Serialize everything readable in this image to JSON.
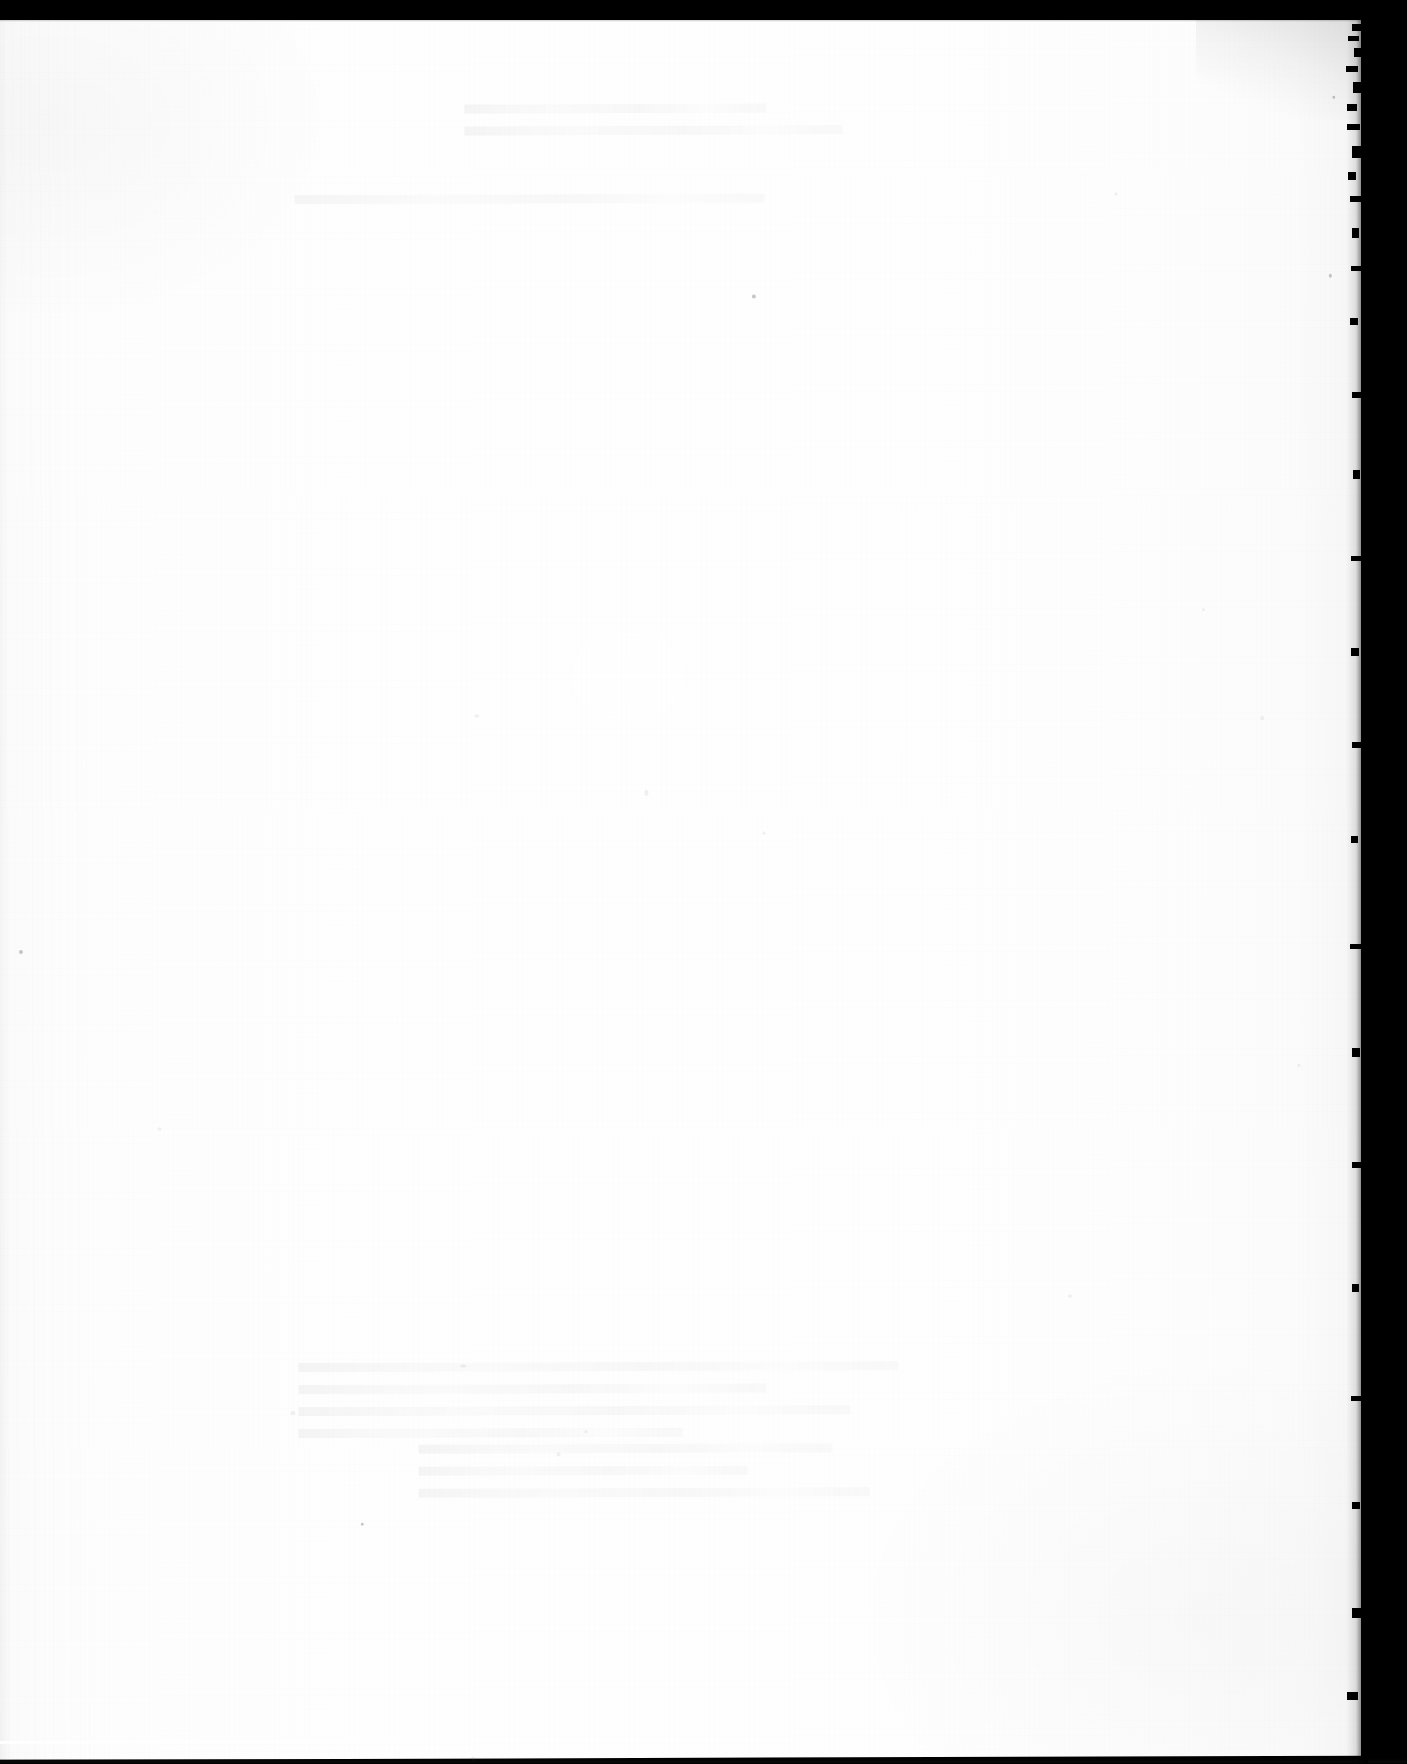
{
  "document": {
    "kind": "scanned-page",
    "page_state": "blank",
    "visible_text": "",
    "printed_content": [],
    "notes": ""
  },
  "canvas": {
    "width": 1407,
    "height": 1764
  },
  "colors": {
    "scanner_backdrop": "#000000",
    "paper_light": "#fefefe",
    "paper_mid": "#fdfdfd",
    "paper_shadow_edge": "#f2f2f3",
    "edge_band": "#000000",
    "showthrough_ink": "#28282f"
  },
  "paper": {
    "left": -6,
    "top": 16,
    "width": 1374,
    "height": 1744,
    "rotation_deg": -0.18,
    "edge_right_x": 1368
  },
  "edges": {
    "top_band_height": 20,
    "right_band_width": 46,
    "bottom_band_height": 5
  },
  "deckle_notches": [
    {
      "top": 24,
      "right": 0,
      "width": 9,
      "height": 7
    },
    {
      "top": 36,
      "right": 2,
      "width": 11,
      "height": 5
    },
    {
      "top": 48,
      "right": 0,
      "width": 7,
      "height": 9
    },
    {
      "top": 66,
      "right": 3,
      "width": 12,
      "height": 6
    },
    {
      "top": 82,
      "right": 0,
      "width": 8,
      "height": 11
    },
    {
      "top": 104,
      "right": 4,
      "width": 10,
      "height": 7
    },
    {
      "top": 124,
      "right": 1,
      "width": 13,
      "height": 6
    },
    {
      "top": 146,
      "right": 0,
      "width": 9,
      "height": 12
    },
    {
      "top": 172,
      "right": 5,
      "width": 8,
      "height": 8
    },
    {
      "top": 196,
      "right": 0,
      "width": 11,
      "height": 6
    },
    {
      "top": 228,
      "right": 2,
      "width": 7,
      "height": 10
    },
    {
      "top": 266,
      "right": 0,
      "width": 10,
      "height": 5
    },
    {
      "top": 318,
      "right": 3,
      "width": 8,
      "height": 7
    },
    {
      "top": 392,
      "right": 0,
      "width": 9,
      "height": 6
    },
    {
      "top": 470,
      "right": 1,
      "width": 7,
      "height": 9
    },
    {
      "top": 556,
      "right": 0,
      "width": 10,
      "height": 5
    },
    {
      "top": 648,
      "right": 2,
      "width": 8,
      "height": 8
    },
    {
      "top": 742,
      "right": 0,
      "width": 9,
      "height": 6
    },
    {
      "top": 836,
      "right": 3,
      "width": 7,
      "height": 7
    },
    {
      "top": 944,
      "right": 0,
      "width": 11,
      "height": 5
    },
    {
      "top": 1048,
      "right": 1,
      "width": 8,
      "height": 9
    },
    {
      "top": 1162,
      "right": 0,
      "width": 9,
      "height": 6
    },
    {
      "top": 1284,
      "right": 2,
      "width": 7,
      "height": 8
    },
    {
      "top": 1396,
      "right": 0,
      "width": 10,
      "height": 5
    },
    {
      "top": 1502,
      "right": 1,
      "width": 8,
      "height": 7
    },
    {
      "top": 1608,
      "right": 0,
      "width": 9,
      "height": 10
    },
    {
      "top": 1692,
      "right": 3,
      "width": 11,
      "height": 8
    }
  ],
  "specks": [
    {
      "left": 757,
      "top": 281,
      "w": 4,
      "h": 4,
      "dark": true
    },
    {
      "left": 22,
      "top": 934,
      "w": 4,
      "h": 4,
      "dark": true
    },
    {
      "left": 362,
      "top": 1508,
      "w": 3,
      "h": 3,
      "dark": true
    },
    {
      "left": 1120,
      "top": 180,
      "w": 3,
      "h": 3,
      "dark": false
    },
    {
      "left": 1206,
      "top": 596,
      "w": 3,
      "h": 3,
      "dark": false
    },
    {
      "left": 478,
      "top": 700,
      "w": 5,
      "h": 3,
      "dark": false
    },
    {
      "left": 648,
      "top": 776,
      "w": 4,
      "h": 6,
      "dark": false
    },
    {
      "left": 766,
      "top": 818,
      "w": 3,
      "h": 3,
      "dark": false
    },
    {
      "left": 1264,
      "top": 704,
      "w": 4,
      "h": 4,
      "dark": false
    },
    {
      "left": 292,
      "top": 1396,
      "w": 5,
      "h": 4,
      "dark": false
    },
    {
      "left": 462,
      "top": 1350,
      "w": 6,
      "h": 3,
      "dark": false
    },
    {
      "left": 558,
      "top": 1438,
      "w": 4,
      "h": 4,
      "dark": false
    },
    {
      "left": 586,
      "top": 1416,
      "w": 3,
      "h": 3,
      "dark": false
    },
    {
      "left": 1070,
      "top": 1282,
      "w": 4,
      "h": 3,
      "dark": false
    },
    {
      "left": 302,
      "top": 1752,
      "w": 3,
      "h": 5,
      "dark": false
    },
    {
      "left": 472,
      "top": 1742,
      "w": 3,
      "h": 6,
      "dark": false
    },
    {
      "left": 1338,
      "top": 84,
      "w": 3,
      "h": 3,
      "dark": true
    },
    {
      "left": 1334,
      "top": 262,
      "w": 3,
      "h": 4,
      "dark": true
    },
    {
      "left": 1300,
      "top": 1052,
      "w": 3,
      "h": 3,
      "dark": false
    },
    {
      "left": 160,
      "top": 1112,
      "w": 4,
      "h": 3,
      "dark": false
    }
  ],
  "showthrough_blocks": [
    {
      "left": 300,
      "top": 1348,
      "width": 600,
      "lines": [
        100,
        78,
        92,
        64
      ]
    },
    {
      "left": 420,
      "top": 1430,
      "width": 470,
      "lines": [
        88,
        70,
        96
      ]
    },
    {
      "left": 470,
      "top": 90,
      "width": 420,
      "lines": [
        72,
        90
      ]
    },
    {
      "left": 300,
      "top": 180,
      "width": 560,
      "lines": [
        84
      ]
    }
  ]
}
